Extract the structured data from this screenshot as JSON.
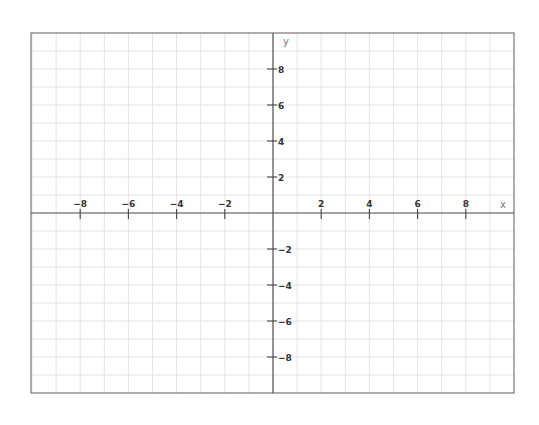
{
  "chart_data": {
    "type": "line",
    "title": "",
    "xlabel": "x",
    "ylabel": "y",
    "xlim": [
      -10,
      9.9
    ],
    "ylim": [
      -10,
      10
    ],
    "grid": true,
    "grid_step": 1,
    "x_ticks": [
      -8,
      -6,
      -4,
      -2,
      2,
      4,
      6,
      8
    ],
    "x_tick_labels": [
      "−8",
      "−6",
      "−4",
      "−2",
      "2",
      "4",
      "6",
      "8"
    ],
    "y_ticks": [
      8,
      6,
      4,
      2,
      -2,
      -4,
      -6,
      -8
    ],
    "y_tick_labels": [
      "8",
      "6",
      "4",
      "2",
      "−2",
      "−4",
      "−6",
      "−8"
    ],
    "series": [],
    "legend": null
  },
  "layout": {
    "frame": {
      "left": 31,
      "top": 33,
      "right": 514,
      "bottom": 393
    },
    "origin": {
      "x": 273,
      "y": 213
    },
    "unit_x": 24.1,
    "unit_y": 18,
    "colors": {
      "grid": "#e3e3e3",
      "frame": "#777777",
      "axis": "#555555",
      "tick_label": "#333333",
      "axis_label": "#777777"
    }
  }
}
